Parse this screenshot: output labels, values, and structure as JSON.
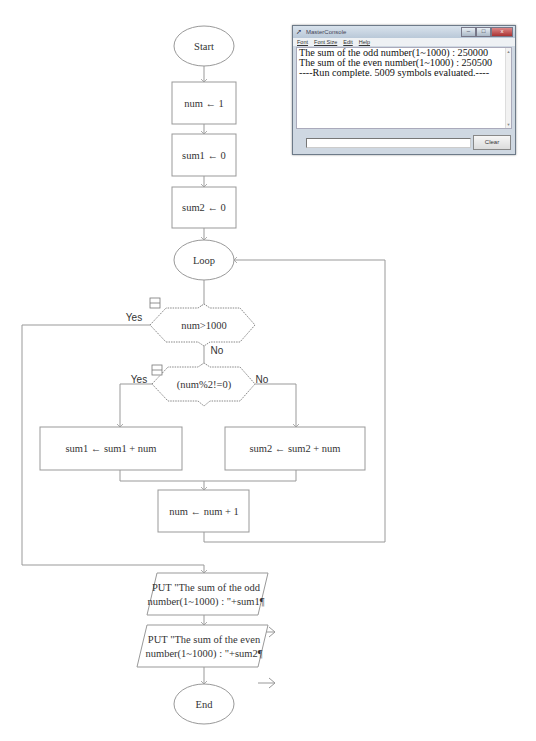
{
  "flowchart": {
    "start": "Start",
    "assign_num": "num ← 1",
    "assign_sum1": "sum1 ← 0",
    "assign_sum2": "sum2 ← 0",
    "loop": "Loop",
    "decision1": {
      "text": "num>1000",
      "yes": "Yes",
      "no": "No"
    },
    "decision2": {
      "text": "(num%2!=0)",
      "yes": "Yes",
      "no": "No"
    },
    "add_sum1": "sum1 ← sum1 + num",
    "add_sum2": "sum2 ← sum2 + num",
    "increment": "num ← num + 1",
    "output1": {
      "line1": "PUT \"The sum of the odd",
      "line2": "number(1~1000) : \"+sum1¶"
    },
    "output2": {
      "line1": "PUT \"The sum of the even",
      "line2": "number(1~1000) : \"+sum2¶"
    },
    "end": "End",
    "line_color": "#999999"
  },
  "console": {
    "title": "MasterConsole",
    "window_buttons": {
      "minimize": "–",
      "maximize": "□",
      "close": "x"
    },
    "menu": [
      "Font",
      "Font Size",
      "Edit",
      "Help"
    ],
    "output_lines": [
      "The sum of the odd number(1~1000) : 250000",
      "The sum of the even number(1~1000) : 250500",
      "----Run complete.  5009 symbols evaluated.----"
    ],
    "input_value": "",
    "clear_label": "Clear"
  }
}
